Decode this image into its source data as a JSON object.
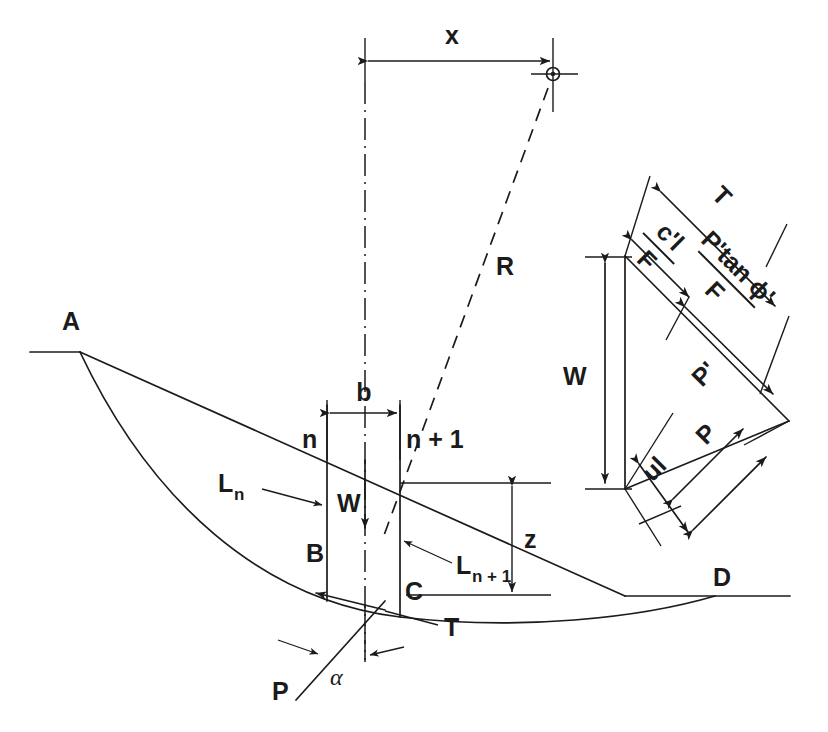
{
  "figure": {
    "type": "engineering-diagram",
    "stroke_color": "#1b1b1b",
    "background_color": "#ffffff"
  },
  "labels": {
    "x_dimension": "x",
    "radius": "R",
    "slice_width": "b",
    "slice_left_boundary": "n",
    "slice_right_boundary": "n + 1",
    "weight": "W",
    "interslice_left": "L",
    "interslice_left_sub": "n",
    "interslice_right": "L",
    "interslice_right_sub": "n + 1",
    "depth": "z",
    "point_a": "A",
    "point_b": "B",
    "point_c": "C",
    "point_d": "D",
    "point_p": "P",
    "base_angle": "α",
    "shear_force": "T"
  },
  "force_polygon": {
    "weight": "W",
    "mobilised_shear": "T",
    "cohesion_term_numerator": "c'l",
    "cohesion_term_denominator": "F",
    "friction_term_numerator": "P'tan ϕ'",
    "friction_term_denominator": "F",
    "effective_normal": "P'",
    "total_normal": "P",
    "pore_water_force": "ul"
  },
  "geometry": {
    "centre_of_rotation": {
      "x": 553,
      "y": 74
    },
    "x_dimension_line": {
      "from_x": 365,
      "to_x": 553,
      "y": 60
    },
    "centreline_x": 365,
    "slice_left_x": 327,
    "slice_right_x": 400,
    "z_dimension_x": 512,
    "z_top_y": 483,
    "z_bottom_y": 595
  }
}
